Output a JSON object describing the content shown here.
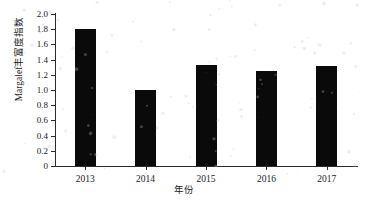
{
  "chart_data": {
    "type": "bar",
    "title": "",
    "xlabel": "年份",
    "ylabel": "Margalef丰富度指数",
    "categories": [
      "2013",
      "2014",
      "2015",
      "2016",
      "2017"
    ],
    "values": [
      1.8,
      1.0,
      1.33,
      1.245,
      1.32
    ],
    "series": [
      {
        "name": "Margalef丰富度指数",
        "values": [
          1.8,
          1.0,
          1.33,
          1.245,
          1.32
        ]
      }
    ],
    "ylim": [
      0,
      2.0
    ],
    "ytick_labels": [
      "2.0",
      "1.8",
      "1.6",
      "1.4",
      "1.2",
      "1.0",
      "0.8",
      "0.6",
      "0.4",
      "0.2",
      "0"
    ],
    "ytick_values": [
      2.0,
      1.8,
      1.6,
      1.4,
      1.2,
      1.0,
      0.8,
      0.6,
      0.4,
      0.2,
      0
    ],
    "ytick_step": 0.2,
    "grid": false,
    "legend": false,
    "legend_position": "none",
    "bar_color": "#0a0a0a",
    "axis_color": "#2b2b2b",
    "background_color": "#ffffff",
    "tick_direction": "out",
    "spines": [
      "left",
      "bottom"
    ]
  }
}
